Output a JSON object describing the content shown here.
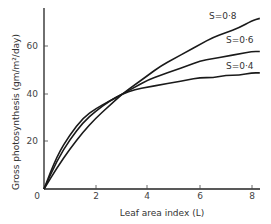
{
  "chart_data": {
    "type": "line",
    "title": "",
    "xlabel": "Leaf area index (L)",
    "ylabel": "Gross photosynthesis (gm/m²/day)",
    "xlim": [
      0,
      8.5
    ],
    "ylim": [
      0,
      75
    ],
    "grid": false,
    "legend_position": "inline-right",
    "x_ticks": [
      0,
      2,
      4,
      6,
      8
    ],
    "y_ticks": [
      20,
      40,
      60
    ],
    "origin_label": "0",
    "x": [
      0,
      0.5,
      1,
      1.5,
      2,
      2.5,
      3,
      3.5,
      4,
      4.5,
      5,
      5.5,
      6,
      6.5,
      7,
      7.5,
      8,
      8.3
    ],
    "series": [
      {
        "name": "S=0·8",
        "values": [
          0,
          9,
          17,
          24,
          30,
          35,
          40,
          44,
          48,
          52,
          55,
          58,
          61,
          64,
          66,
          68,
          71,
          72
        ]
      },
      {
        "name": "S=0·6",
        "values": [
          0,
          12,
          21,
          28,
          33,
          37,
          40,
          43,
          46,
          48,
          50,
          52,
          54,
          55,
          56,
          57,
          58,
          58
        ]
      },
      {
        "name": "S=0·4",
        "values": [
          0,
          14,
          23,
          30,
          34,
          37,
          40,
          42,
          43,
          44,
          45,
          46,
          47,
          47,
          48,
          48,
          49,
          49
        ]
      }
    ]
  },
  "axes": {
    "x_title": "Leaf area index (L)",
    "y_title": "Gross photosynthesis (gm/m²/day)",
    "x_tick_labels": [
      "2",
      "4",
      "6",
      "8"
    ],
    "y_tick_labels": [
      "20",
      "40",
      "60"
    ],
    "origin": "0"
  },
  "labels": {
    "s08": "S=0·8",
    "s06": "S=0·6",
    "s04": "S=0·4"
  },
  "colors": {
    "line": "#1a1a1a",
    "background": "#ffffff"
  }
}
